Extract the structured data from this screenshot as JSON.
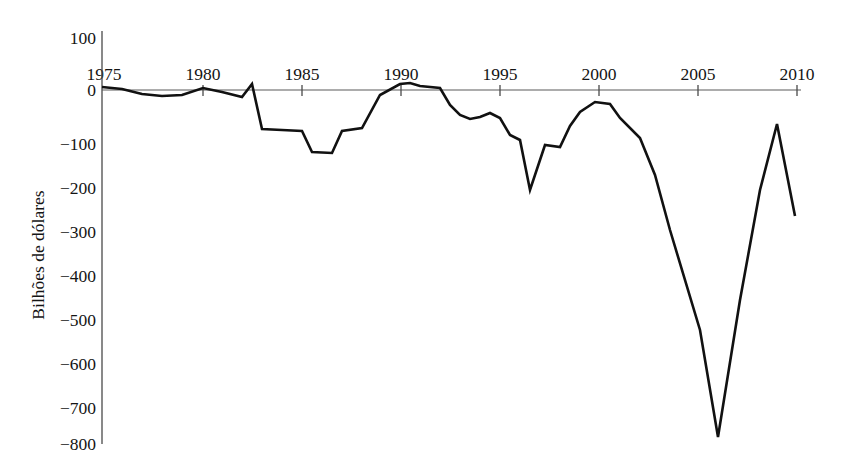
{
  "chart_data": {
    "type": "line",
    "title": "",
    "subtitle": "",
    "xlabel": "",
    "ylabel": "Bilhões de dólares",
    "xlim": [
      1975,
      2010
    ],
    "ylim": [
      -800,
      100
    ],
    "grid": false,
    "legend": null,
    "x_ticks": [
      1975,
      1980,
      1985,
      1990,
      1995,
      2000,
      2005,
      2010
    ],
    "x_tick_labels": [
      "1975",
      "1980",
      "1985",
      "1990",
      "1995",
      "2000",
      "2005",
      "2010"
    ],
    "y_ticks": [
      100,
      0,
      -100,
      -200,
      -300,
      -400,
      -500,
      -600,
      -700,
      -800
    ],
    "y_tick_labels": [
      "100",
      "0",
      "−100",
      "−200",
      "−300",
      "−400",
      "−500",
      "−600",
      "−700",
      "−800"
    ],
    "line_color": "#111111",
    "axis_color": "#4a4a4a",
    "series": [
      {
        "name": "Saldo em conta corrente",
        "x": [
          1975,
          1976,
          1977,
          1978,
          1979,
          1980,
          1981,
          1982,
          1983,
          1984,
          1985,
          1986,
          1987,
          1988,
          1989,
          1990,
          1991,
          1992,
          1993,
          1994,
          1995,
          1996,
          1997,
          1998,
          1999,
          2000,
          2001,
          2002,
          2003,
          2004,
          2005,
          2006,
          2007,
          2008,
          2009,
          2010
        ],
        "values": [
          8,
          5,
          -8,
          -14,
          -12,
          3,
          -2,
          -18,
          -10,
          10,
          -85,
          -90,
          -90,
          -88,
          -130,
          -135,
          -105,
          -40,
          8,
          15,
          5,
          12,
          -55,
          -60,
          -70,
          -65,
          -62,
          -75,
          -130,
          -225,
          -125,
          -130,
          -90,
          -38,
          -25,
          -30
        ]
      }
    ]
  },
  "series_points": {
    "note": "Annual current-account balance values read from the plot, in billions of dollars",
    "data": [
      {
        "year": 1975,
        "value": 8
      },
      {
        "year": 1976,
        "value": 2
      },
      {
        "year": 1977,
        "value": -14
      },
      {
        "year": 1978,
        "value": -15
      },
      {
        "year": 1979,
        "value": -1
      },
      {
        "year": 1980,
        "value": 2
      },
      {
        "year": 1981,
        "value": 5
      },
      {
        "year": 1982,
        "value": -12
      },
      {
        "year": 1983,
        "value": -40
      },
      {
        "year": 1984,
        "value": -95
      },
      {
        "year": 1985,
        "value": -118
      },
      {
        "year": 1986,
        "value": -148
      },
      {
        "year": 1987,
        "value": -162
      },
      {
        "year": 1988,
        "value": -128
      },
      {
        "year": 1989,
        "value": -102
      },
      {
        "year": 1990,
        "value": -80
      },
      {
        "year": 1991,
        "value": 3
      },
      {
        "year": 1992,
        "value": -50
      },
      {
        "year": 1993,
        "value": -85
      },
      {
        "year": 1994,
        "value": -122
      },
      {
        "year": 1995,
        "value": -106
      },
      {
        "year": 1996,
        "value": -121
      },
      {
        "year": 1997,
        "value": -136
      },
      {
        "year": 1998,
        "value": -210
      },
      {
        "year": 1999,
        "value": -297
      },
      {
        "year": 2000,
        "value": -411
      },
      {
        "year": 2001,
        "value": -394
      },
      {
        "year": 2002,
        "value": -458
      },
      {
        "year": 2003,
        "value": -521
      },
      {
        "year": 2004,
        "value": -631
      },
      {
        "year": 2005,
        "value": -748
      },
      {
        "year": 2006,
        "value": -803
      },
      {
        "year": 2007,
        "value": -718
      },
      {
        "year": 2008,
        "value": -669
      },
      {
        "year": 2009,
        "value": -378
      },
      {
        "year": 2010,
        "value": -470
      }
    ]
  },
  "plot_geometry": {
    "x_origin_px": 102,
    "x_per_year_px": 19.83,
    "y_zero_px": 90,
    "y_per_unit_px": 0.44,
    "points_px": [
      [
        102,
        87
      ],
      [
        122,
        89
      ],
      [
        142,
        94
      ],
      [
        162,
        96
      ],
      [
        182,
        95
      ],
      [
        203,
        88
      ],
      [
        222,
        92
      ],
      [
        242,
        97
      ],
      [
        252,
        84
      ],
      [
        262,
        129
      ],
      [
        282,
        130
      ],
      [
        302,
        131
      ],
      [
        312,
        152
      ],
      [
        332,
        153
      ],
      [
        342,
        131
      ],
      [
        362,
        128
      ],
      [
        380,
        95
      ],
      [
        400,
        84
      ],
      [
        410,
        83
      ],
      [
        420,
        86
      ],
      [
        440,
        88
      ],
      [
        450,
        105
      ],
      [
        460,
        115
      ],
      [
        470,
        119
      ],
      [
        480,
        117
      ],
      [
        490,
        113
      ],
      [
        500,
        118
      ],
      [
        510,
        135
      ],
      [
        520,
        140
      ],
      [
        530,
        190
      ],
      [
        545,
        145
      ],
      [
        560,
        147
      ],
      [
        570,
        126
      ],
      [
        580,
        112
      ],
      [
        595,
        102
      ],
      [
        610,
        104
      ],
      [
        620,
        118
      ],
      [
        640,
        138
      ],
      [
        655,
        175
      ],
      [
        670,
        230
      ],
      [
        700,
        330
      ],
      [
        718,
        437
      ],
      [
        740,
        300
      ],
      [
        760,
        190
      ],
      [
        777,
        124
      ],
      [
        795,
        216
      ]
    ]
  }
}
